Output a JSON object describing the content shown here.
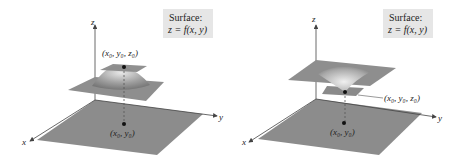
{
  "left": {
    "box_title": "Surface:",
    "box_formula": "z = f(x, y)",
    "axis_x": "x",
    "axis_y": "y",
    "axis_z": "z",
    "point_3d": "(x₀, y₀, z₀)",
    "point_2d": "(x₀, y₀)",
    "type": "maximum"
  },
  "right": {
    "box_title": "Surface:",
    "box_formula": "z = f(x, y)",
    "axis_x": "x",
    "axis_y": "y",
    "axis_z": "z",
    "point_3d": "(x₀, y₀, z₀)",
    "point_2d": "(x₀, y₀)",
    "type": "minimum"
  }
}
